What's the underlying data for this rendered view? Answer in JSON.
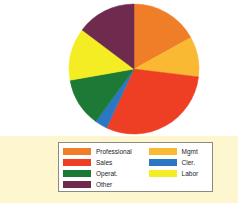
{
  "figure": {
    "background": "#fdfdfb",
    "plot_background": "#ffffff",
    "legend_band_background": "#fdf6cf",
    "legend_box_border": "#8c8c7e"
  },
  "chart_data": {
    "type": "pie",
    "title": "",
    "subtitle": "",
    "xlabel": "",
    "ylabel": "",
    "grid": false,
    "legend_position": "bottom",
    "start_angle_deg": 0,
    "direction": "clockwise",
    "categories": [
      "Professional",
      "Mgmt",
      "Sales",
      "Cler.",
      "Operat.",
      "Labor",
      "Other"
    ],
    "values": [
      17,
      10,
      30,
      3,
      12,
      13,
      15
    ],
    "units": "percent",
    "slices": [
      {
        "label": "Professional",
        "value": 17,
        "color": "#f07d28",
        "start_deg": 0,
        "end_deg": 61
      },
      {
        "label": "Mgmt",
        "value": 10,
        "color": "#f9b933",
        "start_deg": 61,
        "end_deg": 97
      },
      {
        "label": "Sales",
        "value": 30,
        "color": "#ee3e23",
        "start_deg": 97,
        "end_deg": 205
      },
      {
        "label": "Cler.",
        "value": 3,
        "color": "#2b77c4",
        "start_deg": 205,
        "end_deg": 216
      },
      {
        "label": "Operat.",
        "value": 12,
        "color": "#1d7a36",
        "start_deg": 216,
        "end_deg": 260
      },
      {
        "label": "Labor",
        "value": 13,
        "color": "#f5ed24",
        "start_deg": 260,
        "end_deg": 307
      },
      {
        "label": "Other",
        "value": 15,
        "color": "#6e2b4e",
        "start_deg": 307,
        "end_deg": 360
      }
    ]
  },
  "legend": {
    "left_column": [
      {
        "label": "Professional",
        "color": "#f07d28"
      },
      {
        "label": "Sales",
        "color": "#ee3e23"
      },
      {
        "label": "Operat.",
        "color": "#1d7a36"
      },
      {
        "label": "Other",
        "color": "#6e2b4e"
      }
    ],
    "right_column": [
      {
        "label": "Mgmt",
        "color": "#f9b933"
      },
      {
        "label": "Cler.",
        "color": "#2b77c4"
      },
      {
        "label": "Labor",
        "color": "#f5ed24"
      }
    ]
  }
}
